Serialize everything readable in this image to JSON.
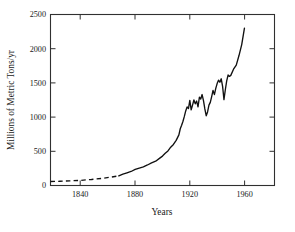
{
  "chart_data": {
    "type": "line",
    "title": "",
    "xlabel": "Years",
    "ylabel": "Millions of Metric Tons/yr",
    "xlim": [
      1818,
      1982
    ],
    "ylim": [
      0,
      2500
    ],
    "xticks": [
      1840,
      1880,
      1920,
      1960
    ],
    "xticklabels": [
      "1840",
      "1880",
      "1920",
      "1960"
    ],
    "yticks": [
      0,
      500,
      1000,
      1500,
      2000,
      2500
    ],
    "yticklabels": [
      "0",
      "500",
      "1000",
      "1500",
      "2000",
      "2500"
    ],
    "grid": false,
    "legend": null,
    "series": [
      {
        "name": "estimated",
        "style": "dashed",
        "color": "#111111",
        "x": [
          1818,
          1825,
          1832,
          1840,
          1848,
          1856,
          1862,
          1868
        ],
        "values": [
          58,
          62,
          68,
          75,
          88,
          105,
          122,
          140
        ]
      },
      {
        "name": "measured",
        "style": "solid",
        "color": "#111111",
        "x": [
          1868,
          1871,
          1874,
          1877,
          1880,
          1883,
          1886,
          1889,
          1892,
          1895,
          1898,
          1900,
          1902,
          1904,
          1906,
          1908,
          1910,
          1912,
          1913,
          1914,
          1915,
          1916,
          1917,
          1918,
          1919,
          1920,
          1921,
          1922,
          1923,
          1924,
          1925,
          1926,
          1927,
          1928,
          1929,
          1930,
          1931,
          1932,
          1933,
          1934,
          1935,
          1936,
          1937,
          1938,
          1939,
          1940,
          1941,
          1942,
          1943,
          1944,
          1945,
          1946,
          1947,
          1948,
          1949,
          1950,
          1952,
          1954,
          1956,
          1958,
          1960
        ],
        "values": [
          140,
          165,
          185,
          205,
          235,
          255,
          272,
          300,
          330,
          355,
          400,
          430,
          470,
          505,
          560,
          600,
          660,
          740,
          830,
          880,
          940,
          1010,
          1090,
          1150,
          1125,
          1245,
          1105,
          1175,
          1250,
          1195,
          1235,
          1150,
          1290,
          1265,
          1330,
          1240,
          1120,
          1020,
          1075,
          1175,
          1215,
          1300,
          1390,
          1330,
          1420,
          1490,
          1540,
          1510,
          1560,
          1450,
          1255,
          1400,
          1530,
          1615,
          1595,
          1610,
          1700,
          1760,
          1900,
          2060,
          2300
        ]
      }
    ]
  }
}
